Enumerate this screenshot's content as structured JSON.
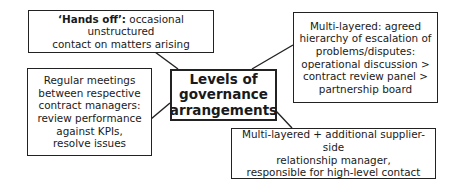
{
  "diagram": {
    "center": {
      "lines": [
        "Levels of",
        "governance",
        "arrangements"
      ]
    },
    "nodes": [
      {
        "id": "hands-off",
        "lines": [
          "‘Hands off’: occasional unstructured",
          "contact on matters arising"
        ]
      },
      {
        "id": "multi-layered",
        "lines": [
          "Multi-layered: agreed",
          "hierarchy of escalation of",
          "problems/disputes:",
          "operational discussion >",
          "contract review panel >",
          "partnership board"
        ]
      },
      {
        "id": "regular-meetings",
        "lines": [
          "Regular meetings",
          "between respective",
          "contract managers:",
          "review performance",
          "against KPIs,",
          "resolve issues"
        ]
      },
      {
        "id": "multi-layered-plus",
        "lines": [
          "Multi-layered + additional supplier-side",
          "relationship manager,",
          "responsible for high-level contact"
        ]
      }
    ]
  }
}
